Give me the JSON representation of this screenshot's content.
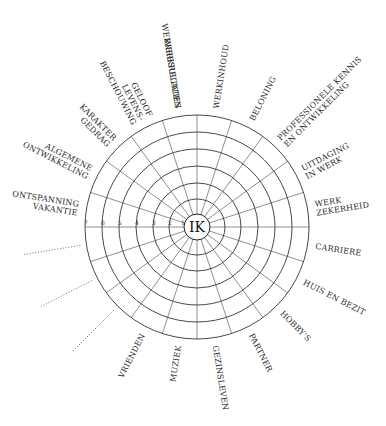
{
  "diagram": {
    "center_label": "IK",
    "scale": [
      "7",
      "6",
      "5",
      "4",
      "3",
      "2",
      "1"
    ],
    "sectors": [
      {
        "label": [
          "WERKRESULTATEN"
        ]
      },
      {
        "label": [
          "WERKINHOUD"
        ]
      },
      {
        "label": [
          "BELONING"
        ]
      },
      {
        "label": [
          "PROFESSIONELE KENNIS",
          "EN ONTWIKKELING"
        ]
      },
      {
        "label": [
          "UITDAGING",
          "IN WERK"
        ]
      },
      {
        "label": [
          "WERK",
          "ZEKERHEID"
        ]
      },
      {
        "label": [
          "CARRIERE"
        ]
      },
      {
        "label": [
          "HUIS EN BEZIT"
        ]
      },
      {
        "label": [
          "HOBBY'S"
        ]
      },
      {
        "label": [
          "PARTNER"
        ]
      },
      {
        "label": [
          "GEZINSLEVEN"
        ]
      },
      {
        "label": [
          "MUZIEK"
        ]
      },
      {
        "label": [
          "VRIENDEN"
        ]
      },
      {
        "label": [],
        "blank": true
      },
      {
        "label": [],
        "blank": true
      },
      {
        "label": [],
        "blank": true
      },
      {
        "label": [
          "ONTSPANNING",
          "VAKANTIE"
        ]
      },
      {
        "label": [
          "ALGEMENE",
          "ONTWIKKELING"
        ]
      },
      {
        "label": [
          "KARAKTER",
          "GEDRAG"
        ]
      },
      {
        "label": [
          "GELOOF",
          "LEVENS-",
          "BESCHOUWING"
        ]
      },
      {
        "label": [
          "WERKRELATIES"
        ]
      }
    ],
    "colors": {
      "line": "#333333",
      "text": "#2a2a2a",
      "background": "#ffffff"
    }
  }
}
